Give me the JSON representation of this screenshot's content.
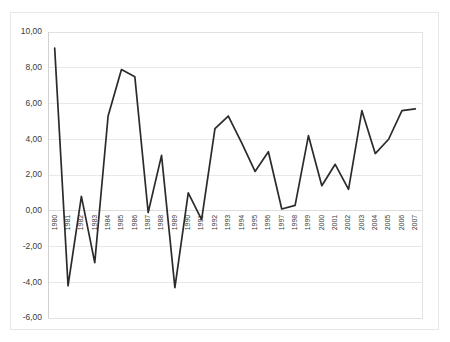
{
  "chart_data": {
    "type": "line",
    "title": "",
    "subtitle": "",
    "xlabel": "",
    "ylabel": "",
    "grid": true,
    "legend": false,
    "legend_position": "none",
    "decimal_separator": ",",
    "ylim": [
      -6.0,
      10.0
    ],
    "ytick_step": 2.0,
    "ytick_labels": [
      "10,00",
      "8,00",
      "6,00",
      "4,00",
      "2,00",
      "0,00",
      "-2,00",
      "-4,00",
      "-6,00"
    ],
    "ytick_values": [
      10.0,
      8.0,
      6.0,
      4.0,
      2.0,
      0.0,
      -2.0,
      -4.0,
      -6.0
    ],
    "categories": [
      "1980",
      "1981",
      "1982",
      "1983",
      "1984",
      "1985",
      "1986",
      "1987",
      "1988",
      "1989",
      "1990",
      "1991",
      "1992",
      "1993",
      "1994",
      "1995",
      "1996",
      "1997",
      "1998",
      "1999",
      "2000",
      "2001",
      "2002",
      "2003",
      "2004",
      "2005",
      "2006",
      "2007"
    ],
    "series": [
      {
        "name": "",
        "color": "#2b2b2b",
        "values": [
          9.1,
          -4.2,
          0.8,
          -2.9,
          5.3,
          7.9,
          7.5,
          -0.1,
          3.1,
          -4.3,
          1.0,
          -0.5,
          4.6,
          5.3,
          3.8,
          2.2,
          3.3,
          0.1,
          0.3,
          4.2,
          1.4,
          2.6,
          1.2,
          5.6,
          3.2,
          4.0,
          5.6,
          5.7
        ]
      }
    ]
  },
  "axes": {
    "y_axis_name": "value-axis",
    "x_axis_name": "category-axis"
  }
}
